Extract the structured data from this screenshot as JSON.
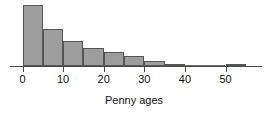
{
  "chart_data": {
    "type": "bar",
    "title": "",
    "subtitle": "",
    "xlabel": "Penny ages",
    "ylabel": "",
    "xlim": [
      -3,
      58
    ],
    "ylim": [
      0,
      47
    ],
    "grid": false,
    "legend": null,
    "bin_width": 5,
    "x_ticks": [
      0,
      10,
      20,
      30,
      40,
      50
    ],
    "x_tick_labels": [
      "0",
      "10",
      "20",
      "30",
      "40",
      "50"
    ],
    "categories": [
      "0-5",
      "5-10",
      "10-15",
      "15-20",
      "20-25",
      "25-30",
      "30-35",
      "35-40",
      "40-45",
      "45-50",
      "50-55"
    ],
    "bin_starts": [
      0,
      5,
      10,
      15,
      20,
      25,
      30,
      35,
      40,
      45,
      50
    ],
    "values": [
      45,
      27,
      18,
      13,
      10,
      7,
      4,
      1,
      0,
      0,
      1
    ],
    "bar_color": "#9d9d9d",
    "bar_edge_color": "#555555",
    "axis_color": "#4a4a4a",
    "background_color": "#ffffff"
  },
  "axis": {
    "x_label_text": "Penny ages"
  }
}
